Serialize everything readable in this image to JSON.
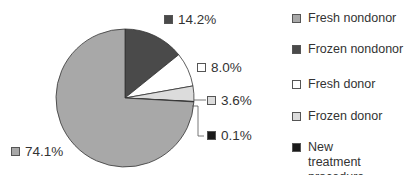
{
  "chart_data": {
    "type": "pie",
    "title": "",
    "categories": [
      "Fresh nondonor",
      "Frozen nondonor",
      "Fresh donor",
      "Frozen donor",
      "New treatment procedure"
    ],
    "values": [
      74.1,
      14.2,
      8.0,
      3.6,
      0.1
    ],
    "labels": [
      "74.1%",
      "14.2%",
      "8.0%",
      "3.6%",
      "0.1%"
    ],
    "colors": [
      "#a8a8a8",
      "#4a4a4a",
      "#ffffff",
      "#dcdcdc",
      "#1a1a1a"
    ],
    "start_angle": "12 o'clock",
    "direction": "clockwise",
    "slice_order": [
      "Frozen nondonor",
      "Fresh donor",
      "Frozen donor",
      "New treatment procedure",
      "Fresh nondonor"
    ],
    "legend_position": "right"
  },
  "legend": {
    "items": [
      {
        "label": "Fresh nondonor",
        "color": "#a8a8a8"
      },
      {
        "label": "Frozen nondonor",
        "color": "#4a4a4a"
      },
      {
        "label": "Fresh donor",
        "color": "#ffffff"
      },
      {
        "label": "Frozen donor",
        "color": "#dcdcdc"
      },
      {
        "label": "New treatment procedure",
        "color": "#1a1a1a"
      }
    ]
  },
  "slice_labels": {
    "fresh_nondonor": "74.1%",
    "frozen_nondonor": "14.2%",
    "fresh_donor": "8.0%",
    "frozen_donor": "3.6%",
    "new_treatment": "0.1%"
  }
}
